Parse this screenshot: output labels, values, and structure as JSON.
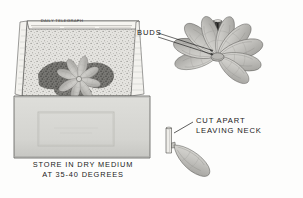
{
  "figure": {
    "style": "vintage line-and-halftone engraving, black and white"
  },
  "box_panel": {
    "name": "storage-box",
    "newspaper_masthead": "DAILY TELEGRAPH",
    "contents_note": "bulb scales set in dry medium inside newspaper-lined box",
    "caption_line1": "STORE IN DRY MEDIUM",
    "caption_line2": "AT 35-40 DEGREES"
  },
  "bulb_panel": {
    "name": "scaled-bulb",
    "label_buds": "BUDS",
    "scale_count": 9
  },
  "detail_panel": {
    "name": "single-scale-detail",
    "label_line1": "CUT APART",
    "label_line2": "LEAVING NECK"
  },
  "colors": {
    "ink": "#1a1a1a",
    "paper": "#fdfdfc",
    "box_face": "#d8d8d6",
    "box_face_shade": "#cfcfcc",
    "medium": "#bdbdb9",
    "scale_fill": "#c9c8c4",
    "scale_shade": "#a9a8a4",
    "dark_clump": "#4a4a48"
  }
}
